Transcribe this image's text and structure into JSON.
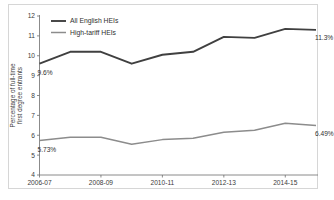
{
  "chart_data": {
    "type": "line",
    "title": "",
    "subtitle": "",
    "xlabel": "",
    "ylabel": "Percentage of full-time first degree entrants",
    "ylabel_line1": "Percentage of full-time",
    "ylabel_line2": "first degree entrants",
    "x": [
      "2006-07",
      "2007-08",
      "2008-09",
      "2009-10",
      "2010-11",
      "2011-12",
      "2012-13",
      "2013-14",
      "2014-15",
      "2015-16"
    ],
    "categories": [
      "2006-07",
      "2007-08",
      "2008-09",
      "2009-10",
      "2010-11",
      "2011-12",
      "2012-13",
      "2013-14",
      "2014-15",
      "2015-16"
    ],
    "xtick_labels": [
      "2006-07",
      "2008-09",
      "2010-11",
      "2012-13",
      "2014-15"
    ],
    "xtick_indices": [
      0,
      2,
      4,
      6,
      8
    ],
    "ytick_labels": [
      "4",
      "5",
      "6",
      "7",
      "8",
      "9",
      "10",
      "11",
      "12"
    ],
    "ytick_values": [
      4,
      5,
      6,
      7,
      8,
      9,
      10,
      11,
      12
    ],
    "ylim": [
      4,
      12
    ],
    "grid": false,
    "legend_position": "top-left",
    "series": [
      {
        "name": "All English HEIs",
        "color": "#404040",
        "values": [
          9.6,
          10.2,
          10.2,
          9.6,
          10.05,
          10.2,
          10.95,
          10.9,
          11.35,
          11.3
        ],
        "point_labels": [
          {
            "index": 0,
            "text": "9.6%",
            "position": "below-left"
          },
          {
            "index": 9,
            "text": "11.3%",
            "position": "below-right"
          }
        ]
      },
      {
        "name": "High-tariff HEIs",
        "color": "#8c8c8c",
        "values": [
          5.73,
          5.9,
          5.9,
          5.55,
          5.78,
          5.85,
          6.15,
          6.25,
          6.6,
          6.49
        ],
        "point_labels": [
          {
            "index": 0,
            "text": "5.73%",
            "position": "below-left"
          },
          {
            "index": 9,
            "text": "6.49%",
            "position": "below-right"
          }
        ]
      }
    ],
    "annotations": [
      {
        "text": "9.6%",
        "series": "All English HEIs",
        "x": "2006-07",
        "value": 9.6
      },
      {
        "text": "11.3%",
        "series": "All English HEIs",
        "x": "2015-16",
        "value": 11.3
      },
      {
        "text": "5.73%",
        "series": "High-tariff HEIs",
        "x": "2006-07",
        "value": 5.73
      },
      {
        "text": "6.49%",
        "series": "High-tariff HEIs",
        "x": "2015-16",
        "value": 6.49
      }
    ]
  },
  "legend": {
    "items": [
      {
        "label": "All English HEIs",
        "color": "#404040"
      },
      {
        "label": "High-tariff HEIs",
        "color": "#8c8c8c"
      }
    ]
  },
  "axes": {
    "y_title_line1": "Percentage of full-time",
    "y_title_line2": "first degree entrants"
  }
}
